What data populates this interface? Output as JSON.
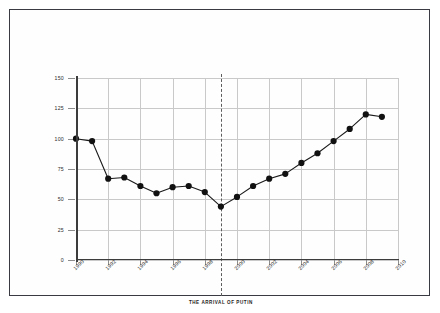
{
  "chart_data": {
    "type": "line",
    "title": "",
    "xlabel": "",
    "ylabel": "",
    "xlim": [
      1990,
      2010
    ],
    "ylim": [
      0,
      150
    ],
    "grid": true,
    "legend": "none",
    "x": [
      1990,
      1991,
      1992,
      1993,
      1994,
      1995,
      1996,
      1997,
      1998,
      1999,
      2000,
      2001,
      2002,
      2003,
      2004,
      2005,
      2006,
      2007,
      2008,
      2009
    ],
    "values": [
      100,
      98,
      67,
      68,
      61,
      55,
      60,
      61,
      56,
      44,
      52,
      61,
      67,
      71,
      80,
      88,
      98,
      108,
      120,
      118
    ],
    "series": [
      {
        "name": "index",
        "values": [
          100,
          98,
          67,
          68,
          61,
          55,
          60,
          61,
          56,
          44,
          52,
          61,
          67,
          71,
          80,
          88,
          98,
          108,
          120,
          118
        ]
      }
    ],
    "y_ticks": [
      0,
      25,
      50,
      75,
      100,
      125,
      150
    ],
    "y_tick_labels": [
      "0",
      "25",
      "50",
      "75",
      "100",
      "125",
      "150"
    ],
    "x_ticks": [
      1990,
      1992,
      1994,
      1996,
      1998,
      2000,
      2002,
      2004,
      2006,
      2008,
      2010
    ],
    "x_tick_labels": [
      "1990",
      "1992",
      "1994",
      "1996",
      "1998",
      "2000",
      "2002",
      "2004",
      "2006",
      "2008",
      "2010"
    ],
    "annotations": [
      {
        "type": "vline",
        "x": 1999,
        "style": "dashed",
        "label": "THE ARRIVAL OF PUTIN"
      }
    ],
    "colors": {
      "line": "#1a1a1a",
      "marker": "#111111",
      "grid": "#c9c9c9",
      "axis": "#3c3c3c",
      "frame": "#3a3a42",
      "background": "#fefefe"
    }
  }
}
